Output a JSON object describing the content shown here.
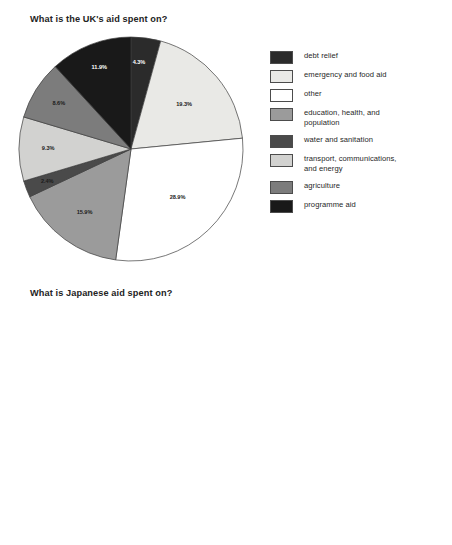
{
  "page": {
    "background": "#ffffff"
  },
  "legend": {
    "items": [
      {
        "label": "debt relief",
        "key": "debt_relief",
        "color": "#2b2b2b",
        "pattern": "solid"
      },
      {
        "label": "emergency and food aid",
        "key": "emergency",
        "color": "#e9e9e6",
        "pattern": "solid"
      },
      {
        "label": "other",
        "key": "other",
        "color": "#ffffff",
        "pattern": "solid"
      },
      {
        "label": "education, health, and\npopulation",
        "key": "education",
        "color": "#9b9b9b",
        "pattern": "solid"
      },
      {
        "label": "water and sanitation",
        "key": "water",
        "color": "#4a4a4a",
        "pattern": "solid"
      },
      {
        "label": "transport, communications,\nand energy",
        "key": "transport",
        "color": "#d2d2d0",
        "pattern": "solid"
      },
      {
        "label": "agriculture",
        "key": "agriculture",
        "color": "#7c7c7c",
        "pattern": "solid"
      },
      {
        "label": "programme aid",
        "key": "programme",
        "color": "#191919",
        "pattern": "solid"
      }
    ]
  },
  "chart_data": [
    {
      "type": "pie",
      "id": "uk",
      "title": "What is the UK's aid spent on?",
      "unit": "%",
      "start_angle": 0,
      "direction": "clockwise",
      "legend_position": "right",
      "categories": [
        "debt relief",
        "emergency and food aid",
        "other",
        "education, health, and population",
        "water and sanitation",
        "transport, communications, and energy",
        "agriculture",
        "programme aid"
      ],
      "values": [
        4.3,
        19.3,
        28.9,
        15.9,
        2.4,
        9.3,
        8.6,
        11.9
      ],
      "labels": [
        "4.3%",
        "19.3%",
        "28.9%",
        "15.9%",
        "2.4%",
        "9.3%",
        "8.6%",
        "11.9%"
      ],
      "colors": [
        "#2b2b2b",
        "#e9e9e6",
        "#ffffff",
        "#9b9b9b",
        "#4a4a4a",
        "#d2d2d0",
        "#7c7c7c",
        "#191919"
      ]
    },
    {
      "type": "pie",
      "id": "japan",
      "title": "What is Japanese aid spent on?",
      "unit": "%",
      "start_angle": 0,
      "direction": "clockwise",
      "legend_position": "right",
      "categories": [
        "debt relief",
        "emergency and food aid",
        "other",
        "education, health, and population",
        "water and sanitation",
        "transport, communications, and energy",
        "agriculture",
        "programme aid"
      ],
      "values": [
        0.6,
        1.6,
        28.4,
        10.7,
        0.7,
        41.1,
        8.8,
        8.7
      ],
      "labels": [
        "0.6%",
        "",
        "28.4%",
        "10.7%",
        "0.7%",
        "41.1%",
        "8.8%",
        "4.4%  4.3%"
      ],
      "colors": [
        "#2b2b2b",
        "#e9e9e6",
        "#ffffff",
        "#9b9b9b",
        "#4a4a4a",
        "#d2d2d0",
        "#7c7c7c",
        "#191919"
      ],
      "callouts": [
        {
          "label": "0.6%",
          "target": "debt relief"
        },
        {
          "label": "0.7%",
          "target": "water and sanitation"
        }
      ],
      "inner_labels": [
        {
          "label": "4.4%"
        },
        {
          "label": "4.3%"
        }
      ]
    }
  ]
}
